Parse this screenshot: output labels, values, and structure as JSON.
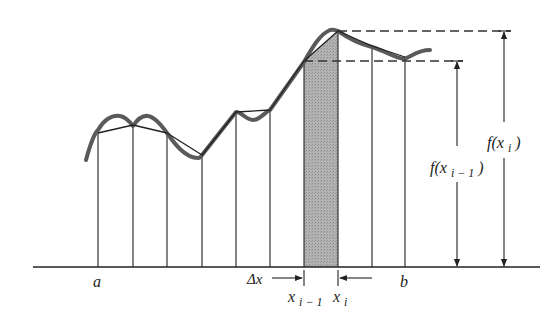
{
  "figure": {
    "type": "trapezoidal-rule-diagram",
    "colors": {
      "curve": "#5a5a5a",
      "lines": "#222222",
      "shade": "#a9a9a9",
      "background": "#ffffff"
    }
  },
  "labels": {
    "a": "a",
    "b": "b",
    "delta_x": "Δx",
    "x_prev_base": "x",
    "x_prev_sub": "i − 1",
    "x_i_base": "x",
    "x_i_sub": "i",
    "f_x_prev_f": "f(x",
    "f_x_prev_sub": "i − 1",
    "f_x_prev_close": ")",
    "f_x_i_f": "f(x",
    "f_x_i_sub": "i",
    "f_x_i_close": ")"
  },
  "geometry": {
    "baseline_y": 267,
    "partition_x": [
      98,
      133,
      167,
      202,
      236,
      270,
      304,
      338,
      372,
      405
    ],
    "polygon_y": [
      133,
      125,
      133,
      155,
      112,
      110,
      61,
      31,
      46,
      57
    ],
    "shaded_strip": {
      "from_index": 6,
      "to_index": 7
    }
  }
}
